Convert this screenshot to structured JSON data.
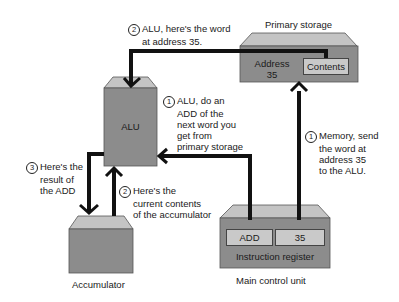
{
  "colors": {
    "box_fill": "#8c8c8c",
    "box_top": "#c4c4c4",
    "cell_fill": "#c9c9c9",
    "arrow": "#111111"
  },
  "components": {
    "alu": {
      "label": "ALU"
    },
    "accumulator": {
      "label": "Accumulator"
    },
    "primary_storage": {
      "label": "Primary storage",
      "address_label": "Address",
      "address_value": "35",
      "contents_label": "Contents"
    },
    "main_control_unit": {
      "label": "Main control unit",
      "register_label": "Instruction register",
      "opcode": "ADD",
      "operand": "35"
    }
  },
  "steps": [
    {
      "num": "1",
      "lines": [
        "ALU, do an",
        "ADD of the",
        "next word you",
        "get from",
        "primary storage"
      ]
    },
    {
      "num": "1",
      "lines": [
        "Memory, send",
        "the word at",
        "address 35",
        "to the ALU."
      ]
    },
    {
      "num": "2",
      "lines": [
        "ALU, here's the word",
        "at address 35."
      ]
    },
    {
      "num": "2",
      "lines": [
        "Here's the",
        "current contents",
        "of the accumulator"
      ]
    },
    {
      "num": "3",
      "lines": [
        "Here's the",
        "result of",
        "the ADD"
      ]
    }
  ]
}
